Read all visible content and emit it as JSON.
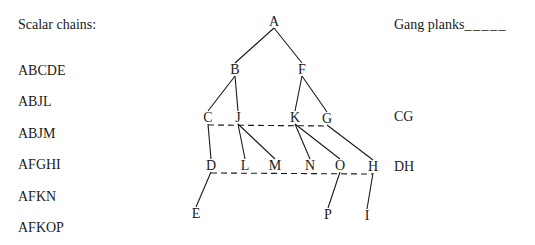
{
  "left_panel": {
    "title": "Scalar chains:",
    "chains": [
      "ABCDE",
      "ABJL",
      "ABJM",
      "AFGHI",
      "AFKN",
      "AFKOP"
    ]
  },
  "right_panel": {
    "legend_label": "Gang planks",
    "legend_sample": "_ _ _ _ _",
    "planks": [
      "CG",
      "DH"
    ]
  },
  "diagram": {
    "nodes": [
      {
        "id": "A",
        "x": 274,
        "y": 26
      },
      {
        "id": "B",
        "x": 235,
        "y": 74
      },
      {
        "id": "F",
        "x": 302,
        "y": 74
      },
      {
        "id": "C",
        "x": 208,
        "y": 122
      },
      {
        "id": "J",
        "x": 238,
        "y": 122
      },
      {
        "id": "K",
        "x": 295,
        "y": 122
      },
      {
        "id": "G",
        "x": 327,
        "y": 123
      },
      {
        "id": "D",
        "x": 211,
        "y": 170
      },
      {
        "id": "L",
        "x": 245,
        "y": 170
      },
      {
        "id": "M",
        "x": 275,
        "y": 170
      },
      {
        "id": "N",
        "x": 310,
        "y": 170
      },
      {
        "id": "O",
        "x": 340,
        "y": 170
      },
      {
        "id": "H",
        "x": 373,
        "y": 171
      },
      {
        "id": "E",
        "x": 196,
        "y": 218
      },
      {
        "id": "P",
        "x": 328,
        "y": 219
      },
      {
        "id": "I",
        "x": 367,
        "y": 220
      }
    ],
    "edges": [
      [
        "A",
        "B"
      ],
      [
        "A",
        "F"
      ],
      [
        "B",
        "C"
      ],
      [
        "B",
        "J"
      ],
      [
        "F",
        "K"
      ],
      [
        "F",
        "G"
      ],
      [
        "C",
        "D"
      ],
      [
        "J",
        "L"
      ],
      [
        "J",
        "M"
      ],
      [
        "K",
        "N"
      ],
      [
        "K",
        "O"
      ],
      [
        "G",
        "H"
      ],
      [
        "D",
        "E"
      ],
      [
        "O",
        "P"
      ],
      [
        "H",
        "I"
      ]
    ],
    "gang_planks": [
      [
        "C",
        "G"
      ],
      [
        "D",
        "H"
      ]
    ]
  }
}
